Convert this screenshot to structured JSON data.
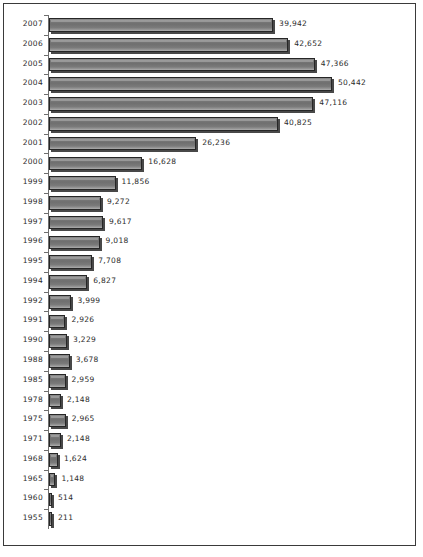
{
  "chart_data": {
    "type": "bar",
    "orientation": "horizontal",
    "title": "",
    "subtitle": "",
    "xlabel": "",
    "ylabel": "",
    "grid": false,
    "legend": null,
    "legend_position": "none",
    "xlim": [
      0,
      50442
    ],
    "axis": {
      "category_axis": "vertical-left",
      "value_axis": "horizontal",
      "tick_labels_shown": false,
      "value_labels_shown": true
    },
    "colors": {
      "bar_fill_light": "#8e8e8e",
      "bar_fill_mid": "#6f6f6f",
      "bar_fill_dark": "#b0b0b0",
      "bar_border": "#262626",
      "bar_shadow": "#141414",
      "axis_line": "#6e6e6e",
      "frame_border": "#3a3a3a",
      "text": "#2b2b2b",
      "background": "#ffffff"
    },
    "categories": [
      "2007",
      "2006",
      "2005",
      "2004",
      "2003",
      "2002",
      "2001",
      "2000",
      "1999",
      "1998",
      "1997",
      "1996",
      "1995",
      "1994",
      "1992",
      "1991",
      "1990",
      "1988",
      "1985",
      "1978",
      "1975",
      "1971",
      "1968",
      "1965",
      "1960",
      "1955"
    ],
    "values": [
      39942,
      42652,
      47366,
      50442,
      47116,
      40825,
      26236,
      16628,
      11856,
      9272,
      9617,
      9018,
      7708,
      6827,
      3999,
      2926,
      3229,
      3678,
      2959,
      2148,
      2965,
      2148,
      1624,
      1148,
      514,
      211
    ],
    "value_labels": [
      "39,942",
      "42,652",
      "47,366",
      "50,442",
      "47,116",
      "40,825",
      "26,236",
      "16,628",
      "11,856",
      "9,272",
      "9,617",
      "9,018",
      "7,708",
      "6,827",
      "3,999",
      "2,926",
      "3,229",
      "3,678",
      "2,959",
      "2,148",
      "2,965",
      "2,148",
      "1,624",
      "1,148",
      "514",
      "211"
    ],
    "rows": [
      {
        "category": "2007",
        "value": 39942,
        "label": "39,942"
      },
      {
        "category": "2006",
        "value": 42652,
        "label": "42,652"
      },
      {
        "category": "2005",
        "value": 47366,
        "label": "47,366"
      },
      {
        "category": "2004",
        "value": 50442,
        "label": "50,442"
      },
      {
        "category": "2003",
        "value": 47116,
        "label": "47,116"
      },
      {
        "category": "2002",
        "value": 40825,
        "label": "40,825"
      },
      {
        "category": "2001",
        "value": 26236,
        "label": "26,236"
      },
      {
        "category": "2000",
        "value": 16628,
        "label": "16,628"
      },
      {
        "category": "1999",
        "value": 11856,
        "label": "11,856"
      },
      {
        "category": "1998",
        "value": 9272,
        "label": "9,272"
      },
      {
        "category": "1997",
        "value": 9617,
        "label": "9,617"
      },
      {
        "category": "1996",
        "value": 9018,
        "label": "9,018"
      },
      {
        "category": "1995",
        "value": 7708,
        "label": "7,708"
      },
      {
        "category": "1994",
        "value": 6827,
        "label": "6,827"
      },
      {
        "category": "1992",
        "value": 3999,
        "label": "3,999"
      },
      {
        "category": "1991",
        "value": 2926,
        "label": "2,926"
      },
      {
        "category": "1990",
        "value": 3229,
        "label": "3,229"
      },
      {
        "category": "1988",
        "value": 3678,
        "label": "3,678"
      },
      {
        "category": "1985",
        "value": 2959,
        "label": "2,959"
      },
      {
        "category": "1978",
        "value": 2148,
        "label": "2,148"
      },
      {
        "category": "1975",
        "value": 2965,
        "label": "2,965"
      },
      {
        "category": "1971",
        "value": 2148,
        "label": "2,148"
      },
      {
        "category": "1968",
        "value": 1624,
        "label": "1,624"
      },
      {
        "category": "1965",
        "value": 1148,
        "label": "1,148"
      },
      {
        "category": "1960",
        "value": 514,
        "label": "514"
      },
      {
        "category": "1955",
        "value": 211,
        "label": "211"
      }
    ]
  }
}
